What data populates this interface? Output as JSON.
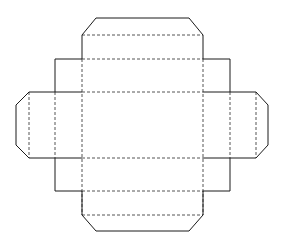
{
  "document": {
    "title": "Box Dieline Net",
    "description": "Flat packaging dieline / carton net with central base panel, four side walls, four end flaps with chamfered corners and four small corner glue tabs",
    "background_color": "#ffffff",
    "cut_line_color": "#1a1a1a",
    "fold_line_color": "#555555",
    "cut_line_style": "solid",
    "fold_line_style": "dashed",
    "canvas": {
      "width": 283,
      "height": 250
    }
  },
  "geometry": {
    "base_panel": {
      "left": 82,
      "top": 92,
      "right": 203,
      "bottom": 158
    },
    "wall_top": {
      "left": 82,
      "top": 59,
      "right": 203,
      "bottom": 92
    },
    "wall_bottom": {
      "left": 82,
      "top": 158,
      "right": 203,
      "bottom": 191
    },
    "wall_left": {
      "left": 55,
      "top": 92,
      "right": 82,
      "bottom": 158
    },
    "wall_right": {
      "left": 203,
      "top": 92,
      "right": 230,
      "bottom": 158
    },
    "flap_top": {
      "left": 82,
      "top": 18,
      "right": 203,
      "bottom": 59,
      "chamfer": 14
    },
    "flap_bottom": {
      "left": 82,
      "top": 191,
      "right": 203,
      "bottom": 231,
      "chamfer": 14
    },
    "flap_left": {
      "left": 16,
      "top": 92,
      "right": 55,
      "bottom": 158,
      "chamfer": 13
    },
    "flap_right": {
      "left": 230,
      "top": 92,
      "right": 268,
      "bottom": 158,
      "chamfer": 13
    },
    "tab_top_left": {
      "left": 55,
      "top": 59,
      "right": 82,
      "bottom": 92
    },
    "tab_top_right": {
      "left": 203,
      "top": 59,
      "right": 230,
      "bottom": 92
    },
    "tab_bottom_left": {
      "left": 55,
      "top": 158,
      "right": 82,
      "bottom": 191
    },
    "tab_bottom_right": {
      "left": 203,
      "top": 158,
      "right": 230,
      "bottom": 191
    }
  },
  "paths": {
    "outline_cut": "M 82 35 L 96 18 L 189 18 L 203 35 L 203 59 L 230 59 L 230 92 L 256 92 L 268 105 L 268 145 L 256 158 L 230 158 L 230 191 L 203 191 L 203 215 L 189 231 L 96 231 L 82 215 L 82 191 L 55 191 L 55 158 L 29 158 L 16 145 L 16 105 L 29 92 L 55 92 L 55 59 L 82 59 Z",
    "fold_top_flap": "M 82 35 L 203 35",
    "fold_top_wall": "M 82 59 L 203 59",
    "fold_base_top": "M 82 92 L 203 92",
    "fold_base_bottom": "M 82 158 L 203 158",
    "fold_bottom_wall": "M 82 191 L 203 191",
    "fold_bottom_flap": "M 82 215 L 203 215",
    "fold_left_wall": "M 82 59 L 82 215",
    "fold_right_wall": "M 203 59 L 203 215",
    "fold_left_flap": "M 55 92 L 55 158",
    "fold_right_flap": "M 230 92 L 230 158",
    "fold_left_tab_edge": "M 29 92 L 29 158",
    "fold_right_tab_edge": "M 256 92 L 256 158"
  },
  "labels": {
    "base_panel": "base-panel",
    "top_wall": "top-wall-panel",
    "bottom_wall": "bottom-wall-panel",
    "left_wall": "left-wall-panel",
    "right_wall": "right-wall-panel",
    "top_flap": "top-closure-flap",
    "bottom_flap": "bottom-closure-flap",
    "left_flap": "left-closure-flap",
    "right_flap": "right-closure-flap"
  }
}
